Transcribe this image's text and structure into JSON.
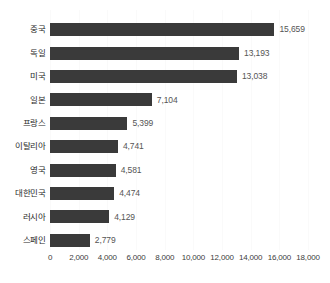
{
  "chart_data": {
    "type": "bar",
    "orientation": "horizontal",
    "title": "",
    "subtitle": "",
    "xlabel": "",
    "ylabel": "",
    "xlim": [
      0,
      18000
    ],
    "grid": true,
    "legend": false,
    "legend_position": "none",
    "categories": [
      "중국",
      "독일",
      "미국",
      "일본",
      "프랑스",
      "이탈리아",
      "영국",
      "대한민국",
      "러시아",
      "스페인"
    ],
    "values": [
      15659,
      13193,
      13038,
      7104,
      5399,
      4741,
      4581,
      4474,
      4129,
      2779
    ],
    "value_labels": [
      "15,659",
      "13,193",
      "13,038",
      "7,104",
      "5,399",
      "4,741",
      "4,581",
      "4,474",
      "4,129",
      "2,779"
    ],
    "xticks": [
      0,
      2000,
      4000,
      6000,
      8000,
      10000,
      12000,
      14000,
      16000,
      18000
    ],
    "xtick_labels": [
      "0",
      "2,000",
      "4,000",
      "6,000",
      "8,000",
      "10,000",
      "12,000",
      "14,000",
      "16,000",
      "18,000"
    ],
    "colors": {
      "bar": "#3a3a3a",
      "value_label": "#555555",
      "category_label": "#2b2b2b",
      "tick_label": "#3d3d3d",
      "gridline": "#fafafa",
      "background": "#ffffff"
    }
  }
}
